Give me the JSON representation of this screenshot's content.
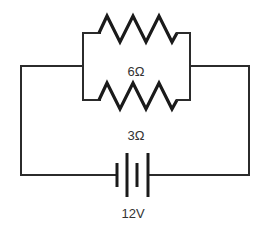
{
  "diagram": {
    "type": "circuit",
    "components": [
      {
        "kind": "resistor",
        "label": "6Ω",
        "position": "parallel-top"
      },
      {
        "kind": "resistor",
        "label": "3Ω",
        "position": "parallel-bottom"
      },
      {
        "kind": "battery",
        "label": "12V",
        "position": "bottom"
      }
    ],
    "labels": {
      "r1": "6Ω",
      "r2": "3Ω",
      "battery": "12V"
    },
    "colors": {
      "wire": "#2b2b2b",
      "background": "#ffffff"
    }
  }
}
